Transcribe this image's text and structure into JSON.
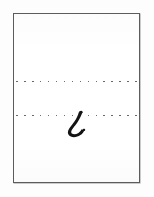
{
  "document": {
    "kind": "handwriting-sample-card",
    "title": "Handwriting sample card",
    "background_color": "#fdfdfd",
    "page": {
      "background_color": "#ffffff",
      "border_color": "#5c5c5c",
      "border_width_px": 1,
      "x": 13,
      "y": 13,
      "width": 127,
      "height": 170
    }
  },
  "guide_lines": [
    {
      "id": "top",
      "name": "upper-guide-line",
      "style": "dotted",
      "color": "#4a4a4a",
      "y": 66,
      "dot_count": 16,
      "dot_size_px": 1.6
    },
    {
      "id": "bottom",
      "name": "lower-baseline-guide-line",
      "style": "dotted",
      "color": "#4a4a4a",
      "y": 100,
      "dot_count": 16,
      "dot_size_px": 1.6
    }
  ],
  "handwriting": {
    "glyph": "ᘓ",
    "description": "thick handwritten hook stroke descending and curving left then up to the right",
    "ink_color": "#141414",
    "sits_on_line": "bottom",
    "x": 47,
    "y": 95,
    "width": 30,
    "height": 32
  }
}
